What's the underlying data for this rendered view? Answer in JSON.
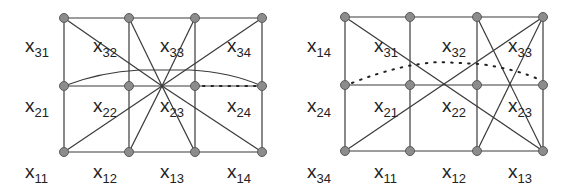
{
  "diagrams": [
    {
      "id": "left",
      "columns_x": [
        64,
        129,
        195,
        262
      ],
      "rows_y": [
        18,
        86,
        152
      ],
      "labels": [
        {
          "var": "x",
          "sub": "31",
          "x": 25,
          "y": 52
        },
        {
          "var": "x",
          "sub": "32",
          "x": 93,
          "y": 52
        },
        {
          "var": "x",
          "sub": "33",
          "x": 160,
          "y": 52
        },
        {
          "var": "x",
          "sub": "34",
          "x": 227,
          "y": 52
        },
        {
          "var": "x",
          "sub": "21",
          "x": 25,
          "y": 112
        },
        {
          "var": "x",
          "sub": "22",
          "x": 93,
          "y": 112
        },
        {
          "var": "x",
          "sub": "23",
          "x": 160,
          "y": 112
        },
        {
          "var": "x",
          "sub": "24",
          "x": 227,
          "y": 112
        },
        {
          "var": "x",
          "sub": "11",
          "x": 25,
          "y": 178
        },
        {
          "var": "x",
          "sub": "12",
          "x": 93,
          "y": 178
        },
        {
          "var": "x",
          "sub": "13",
          "x": 160,
          "y": 178
        },
        {
          "var": "x",
          "sub": "14",
          "x": 227,
          "y": 178
        }
      ]
    },
    {
      "id": "right",
      "columns_x": [
        345,
        410,
        477,
        543
      ],
      "rows_y": [
        17,
        85,
        151
      ],
      "labels": [
        {
          "var": "x",
          "sub": "14",
          "x": 307,
          "y": 52
        },
        {
          "var": "x",
          "sub": "31",
          "x": 374,
          "y": 52
        },
        {
          "var": "x",
          "sub": "32",
          "x": 442,
          "y": 52
        },
        {
          "var": "x",
          "sub": "33",
          "x": 508,
          "y": 52
        },
        {
          "var": "x",
          "sub": "24",
          "x": 307,
          "y": 112
        },
        {
          "var": "x",
          "sub": "21",
          "x": 374,
          "y": 112
        },
        {
          "var": "x",
          "sub": "22",
          "x": 442,
          "y": 112
        },
        {
          "var": "x",
          "sub": "23",
          "x": 508,
          "y": 112
        },
        {
          "var": "x",
          "sub": "34",
          "x": 307,
          "y": 178
        },
        {
          "var": "x",
          "sub": "11",
          "x": 374,
          "y": 178
        },
        {
          "var": "x",
          "sub": "12",
          "x": 442,
          "y": 178
        },
        {
          "var": "x",
          "sub": "13",
          "x": 508,
          "y": 178
        }
      ]
    }
  ]
}
